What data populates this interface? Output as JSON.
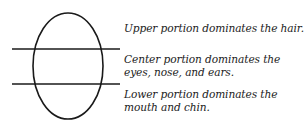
{
  "diagram": {
    "shape": "oval",
    "divider_lines": 2,
    "stroke_color": "#1a1a1a",
    "text_color": "#222222",
    "labels": [
      {
        "id": "upper",
        "lines": [
          "Upper portion dominates the hair."
        ]
      },
      {
        "id": "center",
        "lines": [
          "Center portion dominates the",
          "eyes, nose, and ears."
        ]
      },
      {
        "id": "lower",
        "lines": [
          "Lower portion dominates the",
          "mouth and chin."
        ]
      }
    ]
  }
}
